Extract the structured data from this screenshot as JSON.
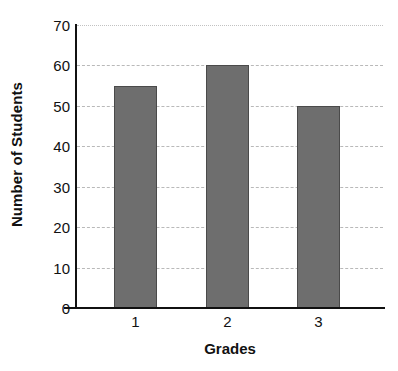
{
  "chart_data": {
    "type": "bar",
    "title": "",
    "subtitle": "",
    "categories": [
      "1",
      "2",
      "3"
    ],
    "values": [
      55,
      60,
      50
    ],
    "xlabel": "Grades",
    "ylabel": "Number of Students",
    "ylim": [
      0,
      70
    ],
    "yticks": [
      0,
      10,
      20,
      30,
      40,
      50,
      60,
      70
    ],
    "ytick_labels": [
      "0",
      "10",
      "20",
      "30",
      "40",
      "50",
      "60",
      "70"
    ],
    "grid": true,
    "grid_axis": "y",
    "legend": false,
    "legend_position": "none",
    "series": [
      {
        "name": "Number of Students",
        "values": [
          55,
          60,
          50
        ]
      }
    ],
    "annotations": []
  },
  "style": {
    "bar_fill": "#6e6e6e",
    "bar_border": "#4a4a4a",
    "gridline_color": "#b9b9b9",
    "axis_color": "#111111",
    "background": "#ffffff",
    "text_color": "#111111"
  }
}
